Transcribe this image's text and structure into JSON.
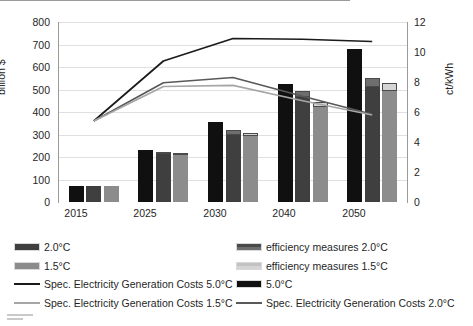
{
  "chart_data": {
    "type": "bar",
    "title": "",
    "categories": [
      "2015",
      "2025",
      "2030",
      "2040",
      "2050"
    ],
    "xlabel": "",
    "ylabel": "billion $",
    "ylabel_secondary": "ct/kWh",
    "ylim": [
      0,
      800
    ],
    "yticks": [
      "0",
      "100",
      "200",
      "300",
      "400",
      "500",
      "600",
      "700",
      "800"
    ],
    "ylim_secondary": [
      0,
      12
    ],
    "yticks_secondary": [
      "0",
      "2",
      "4",
      "6",
      "8",
      "10",
      "12"
    ],
    "grid": true,
    "legend_position": "bottom",
    "bar_series": [
      {
        "name": "5.0°C",
        "axis": "left",
        "color": "#101010",
        "values": [
          72,
          231,
          355,
          524,
          680
        ],
        "efficiency": [
          0,
          0,
          0,
          0,
          0
        ]
      },
      {
        "name": "2.0°C",
        "axis": "left",
        "color": "#3f3f3f",
        "values": [
          72,
          214,
          300,
          466,
          512
        ],
        "efficiency_name": "efficiency measures 2.0°C",
        "efficiency_color": "#6e6e6e",
        "efficiency": [
          0,
          6,
          18,
          28,
          38
        ]
      },
      {
        "name": "1.5°C",
        "axis": "left",
        "color": "#8c8c8c",
        "values": [
          72,
          208,
          292,
          424,
          492
        ],
        "efficiency_name": "efficiency measures 1.5°C",
        "efficiency_color": "#d4d4d4",
        "efficiency": [
          0,
          5,
          14,
          22,
          38
        ]
      }
    ],
    "line_series": [
      {
        "name": "Spec. Electricity Generation Costs 5.0°C",
        "axis": "right",
        "color": "#1a1a1a",
        "values": [
          5.4,
          9.4,
          10.9,
          10.85,
          10.7
        ]
      },
      {
        "name": "Spec. Electricity Generation Costs 2.0°C",
        "axis": "right",
        "color": "#595959",
        "values": [
          5.4,
          7.95,
          8.3,
          7.05,
          5.85
        ]
      },
      {
        "name": "Spec. Electricity Generation Costs 1.5°C",
        "axis": "right",
        "color": "#a6a6a6",
        "values": [
          5.4,
          7.7,
          7.78,
          6.75,
          5.8
        ]
      }
    ]
  },
  "legend": {
    "column_left": [
      {
        "label": "2.0°C",
        "type": "swatch",
        "color": "#3f3f3f"
      },
      {
        "label": "1.5°C",
        "type": "swatch",
        "color": "#8c8c8c"
      },
      {
        "label": "Spec. Electricity Generation Costs 5.0°C",
        "type": "line",
        "color": "#1a1a1a"
      },
      {
        "label": "Spec. Electricity Generation Costs 1.5°C",
        "type": "line",
        "color": "#a6a6a6"
      }
    ],
    "column_right": [
      {
        "label": "efficiency measures 2.0°C",
        "type": "swatch-split",
        "color": "#6e6e6e",
        "color_top": "#4a4a4a"
      },
      {
        "label": "efficiency measures 1.5°C",
        "type": "swatch-split",
        "color": "#d4d4d4",
        "color_top": "#c2c2c2"
      },
      {
        "label": "5.0°C",
        "type": "swatch",
        "color": "#101010"
      },
      {
        "label": "Spec. Electricity Generation Costs 2.0°C",
        "type": "line",
        "color": "#595959"
      }
    ]
  }
}
